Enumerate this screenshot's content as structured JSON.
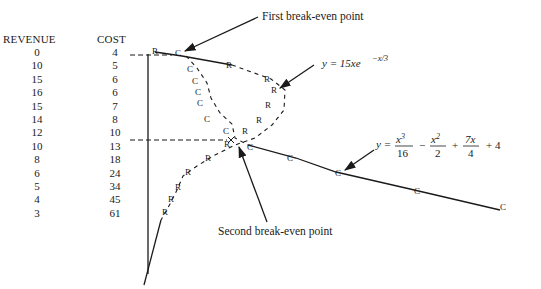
{
  "table": {
    "headers": {
      "revenue": "REVENUE",
      "cost": "COST"
    },
    "rows": [
      {
        "revenue": "0",
        "cost": "4"
      },
      {
        "revenue": "10",
        "cost": "5"
      },
      {
        "revenue": "15",
        "cost": "6"
      },
      {
        "revenue": "16",
        "cost": "6"
      },
      {
        "revenue": "15",
        "cost": "7"
      },
      {
        "revenue": "14",
        "cost": "8"
      },
      {
        "revenue": "12",
        "cost": "10"
      },
      {
        "revenue": "10",
        "cost": "13"
      },
      {
        "revenue": "8",
        "cost": "18"
      },
      {
        "revenue": "6",
        "cost": "24"
      },
      {
        "revenue": "5",
        "cost": "34"
      },
      {
        "revenue": "4",
        "cost": "45"
      },
      {
        "revenue": "3",
        "cost": "61"
      }
    ]
  },
  "annotations": {
    "first_break_even": "First break-even point",
    "second_break_even": "Second break-even point",
    "revenue_eq": "y = 15xe",
    "revenue_eq_exp": "−x/3",
    "cost_eq": {
      "y": "y =",
      "t1_num": "x3",
      "t1_den": "16",
      "minus": "−",
      "t2_num": "x2",
      "t2_den": "2",
      "plus1": "+",
      "t3_num": "7x",
      "t3_den": "4",
      "plus2": "+ 4"
    },
    "revenue_marker": "R",
    "cost_marker": "C"
  },
  "chart_data": {
    "type": "scatter",
    "title": "",
    "series": [
      {
        "name": "Revenue",
        "marker": "R",
        "equation": "y = 15xe^(-x/3)",
        "values": [
          0,
          10,
          15,
          16,
          15,
          14,
          12,
          10,
          8,
          6,
          5,
          4,
          3
        ]
      },
      {
        "name": "Cost",
        "marker": "C",
        "equation": "y = x^3/16 - x^2/2 + 7x/4 + 4",
        "values": [
          4,
          5,
          6,
          6,
          7,
          8,
          10,
          13,
          18,
          24,
          34,
          45,
          61
        ]
      }
    ],
    "annotations": [
      "First break-even point",
      "Second break-even point"
    ],
    "xlabel": "",
    "ylabel": "",
    "grid": false,
    "legend": "none"
  }
}
